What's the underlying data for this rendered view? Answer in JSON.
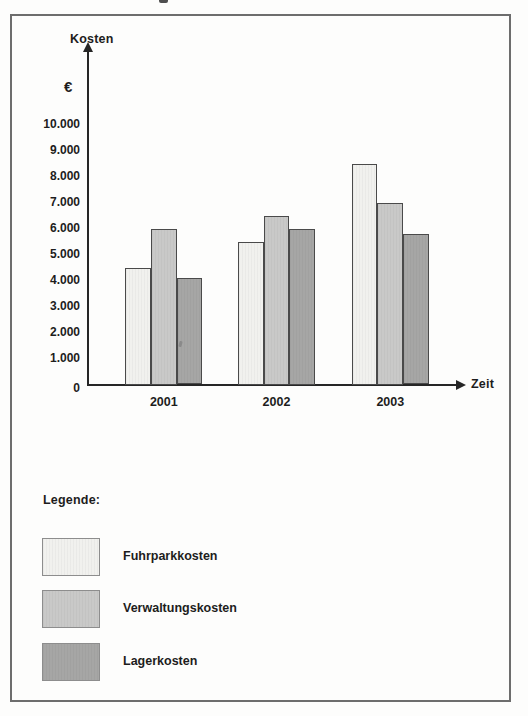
{
  "figure": {
    "legend_heading": "Legende:"
  },
  "chart_data": {
    "type": "bar",
    "title": "",
    "ylabel": "Kosten",
    "y_unit": "€",
    "xlabel": "Zeit",
    "categories": [
      "2001",
      "2002",
      "2003"
    ],
    "series": [
      {
        "name": "Fuhrparkkosten",
        "color": "#f1f1ee",
        "values": [
          4500,
          5500,
          8500
        ]
      },
      {
        "name": "Verwaltungskosten",
        "color": "#c9c9c8",
        "values": [
          6000,
          6500,
          7000
        ]
      },
      {
        "name": "Lagerkosten",
        "color": "#a6a6a5",
        "values": [
          4100,
          6000,
          5800
        ]
      }
    ],
    "y_ticks": [
      "10.000",
      "9.000",
      "8.000",
      "7.000",
      "6.000",
      "5.000",
      "4.000",
      "3.000",
      "2.000",
      "1.000",
      "0"
    ],
    "ylim": [
      0,
      10500
    ],
    "grid": false,
    "legend_position": "bottom",
    "axis_color": "#262626"
  }
}
